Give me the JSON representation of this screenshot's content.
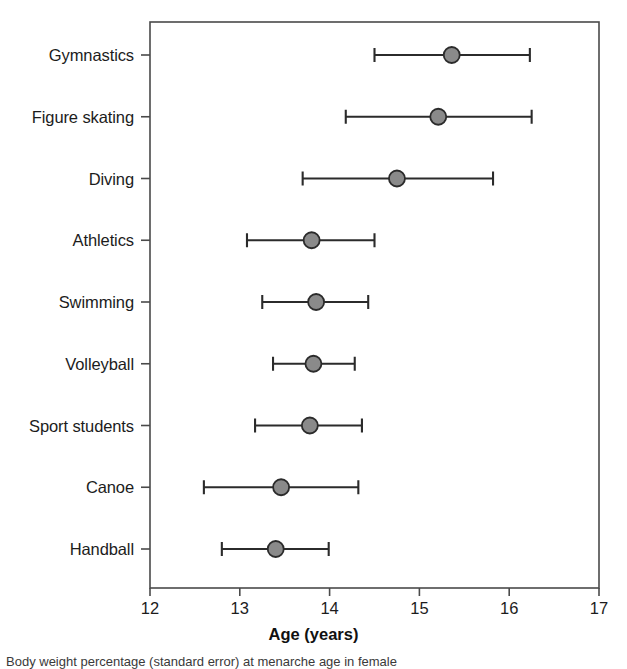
{
  "chart_data": {
    "type": "scatter",
    "title": "",
    "xlabel": "Age (years)",
    "ylabel": "",
    "xlim": [
      12,
      17
    ],
    "xticks": [
      12,
      13,
      14,
      15,
      16,
      17
    ],
    "xtick_labels": [
      "12",
      "13",
      "14",
      "15",
      "16",
      "17"
    ],
    "grid": false,
    "legend": null,
    "orientation": "horizontal",
    "error_bars": "horizontal",
    "categories": [
      "Gymnastics",
      "Figure skating",
      "Diving",
      "Athletics",
      "Swimming",
      "Volleyball",
      "Sport students",
      "Canoe",
      "Handball"
    ],
    "points": [
      {
        "category": "Gymnastics",
        "value": 15.36,
        "low": 14.5,
        "high": 16.23
      },
      {
        "category": "Figure skating",
        "value": 15.21,
        "low": 14.18,
        "high": 16.25
      },
      {
        "category": "Diving",
        "value": 14.75,
        "low": 13.7,
        "high": 15.82
      },
      {
        "category": "Athletics",
        "value": 13.8,
        "low": 13.08,
        "high": 14.5
      },
      {
        "category": "Swimming",
        "value": 13.85,
        "low": 13.25,
        "high": 14.43
      },
      {
        "category": "Volleyball",
        "value": 13.82,
        "low": 13.37,
        "high": 14.28
      },
      {
        "category": "Sport students",
        "value": 13.78,
        "low": 13.17,
        "high": 14.36
      },
      {
        "category": "Canoe",
        "value": 13.46,
        "low": 12.6,
        "high": 14.32
      },
      {
        "category": "Handball",
        "value": 13.4,
        "low": 12.8,
        "high": 13.99
      }
    ],
    "marker_color": "#8a8a8a",
    "marker_edge_color": "#2b2b2b",
    "line_color": "#2b2b2b",
    "axis_color": "#4a4a4a"
  },
  "caption": {
    "text": "Body weight percentage (standard error) at menarche age in female"
  }
}
